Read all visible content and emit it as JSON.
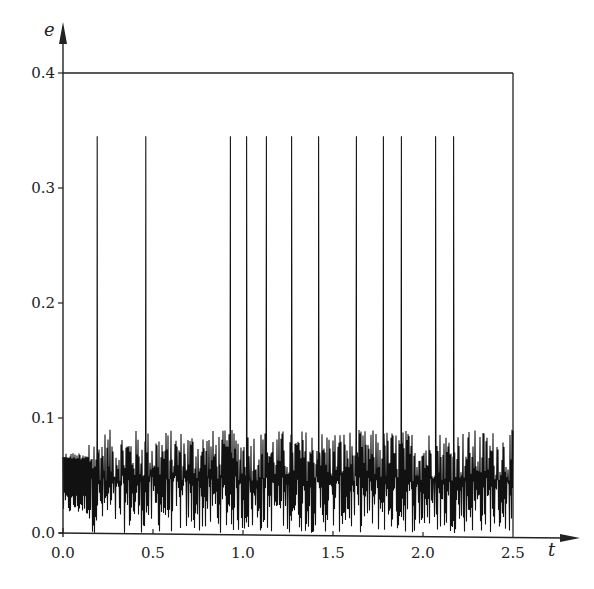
{
  "chart_data": {
    "type": "line",
    "title": "",
    "xlabel": "t",
    "ylabel": "e",
    "xlim": [
      0.0,
      2.5
    ],
    "ylim": [
      0.0,
      0.4
    ],
    "grid": false,
    "legend": null,
    "x_ticks": [
      "0.0",
      "0.5",
      "1.0",
      "1.5",
      "2.0",
      "2.5"
    ],
    "y_ticks": [
      "0.0",
      "0.1",
      "0.2",
      "0.3",
      "0.4"
    ],
    "series": [
      {
        "name": "e(t)",
        "description": "Chaotic oscillation with baseline fluctuating between ~0.0 and ~0.09, punctuated by sharp spikes reaching ~0.345",
        "baseline_range": [
          0.0,
          0.09
        ],
        "initial_segment": {
          "t_range": [
            0.0,
            0.14
          ],
          "range": [
            0.015,
            0.07
          ]
        },
        "spikes": {
          "t": [
            0.19,
            0.46,
            0.93,
            1.02,
            1.13,
            1.27,
            1.42,
            1.63,
            1.78,
            1.88,
            2.07,
            2.17
          ],
          "peak": 0.345
        }
      }
    ],
    "frame": {
      "top_line_at": 0.4,
      "right_line_at": 2.5
    }
  },
  "labels": {
    "x_axis": "t",
    "y_axis": "e"
  },
  "style": {
    "line_color": "#111111",
    "axis_color": "#222222",
    "background": "#ffffff"
  }
}
